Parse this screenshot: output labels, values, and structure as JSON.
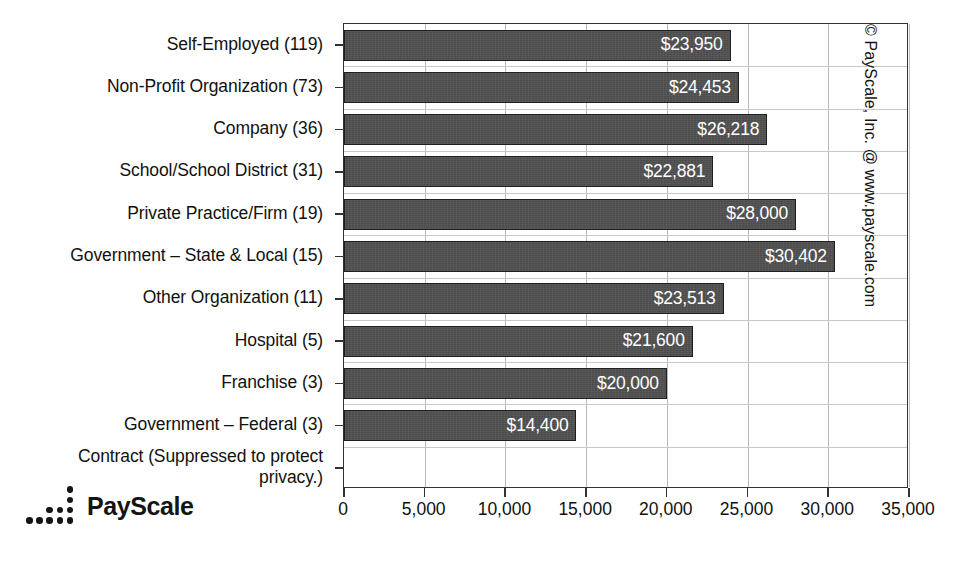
{
  "chart_data": {
    "type": "bar",
    "orientation": "horizontal",
    "title": "",
    "xlabel": "",
    "ylabel": "",
    "xlim": [
      0,
      35000
    ],
    "xticks": [
      0,
      5000,
      10000,
      15000,
      20000,
      25000,
      30000,
      35000
    ],
    "xtick_labels": [
      "0",
      "5,000",
      "10,000",
      "15,000",
      "20,000",
      "25,000",
      "30,000",
      "35,000"
    ],
    "grid": true,
    "legend": "none",
    "bar_color": "#4b4b4b",
    "categories": [
      "Self-Employed (119)",
      "Non-Profit Organization (73)",
      "Company (36)",
      "School/School District (31)",
      "Private Practice/Firm (19)",
      "Government – State & Local (15)",
      "Other Organization (11)",
      "Hospital (5)",
      "Franchise (3)",
      "Government – Federal (3)",
      "Contract (Suppressed to protect\nprivacy.)"
    ],
    "values": [
      23950,
      24453,
      26218,
      22881,
      28000,
      30402,
      23513,
      21600,
      20000,
      14400,
      null
    ],
    "value_labels": [
      "$23,950",
      "$24,453",
      "$26,218",
      "$22,881",
      "$28,000",
      "$30,402",
      "$23,513",
      "$21,600",
      "$20,000",
      "$14,400",
      ""
    ],
    "counts": [
      119,
      73,
      36,
      31,
      19,
      15,
      11,
      5,
      3,
      3,
      null
    ],
    "annotations": [
      "Contract (Suppressed to protect privacy.)"
    ]
  },
  "branding": {
    "logo_text": "PayScale",
    "logo_icon": "payscale-dots-logo",
    "copyright": "© PayScale, Inc. @ www.payscale.com"
  }
}
